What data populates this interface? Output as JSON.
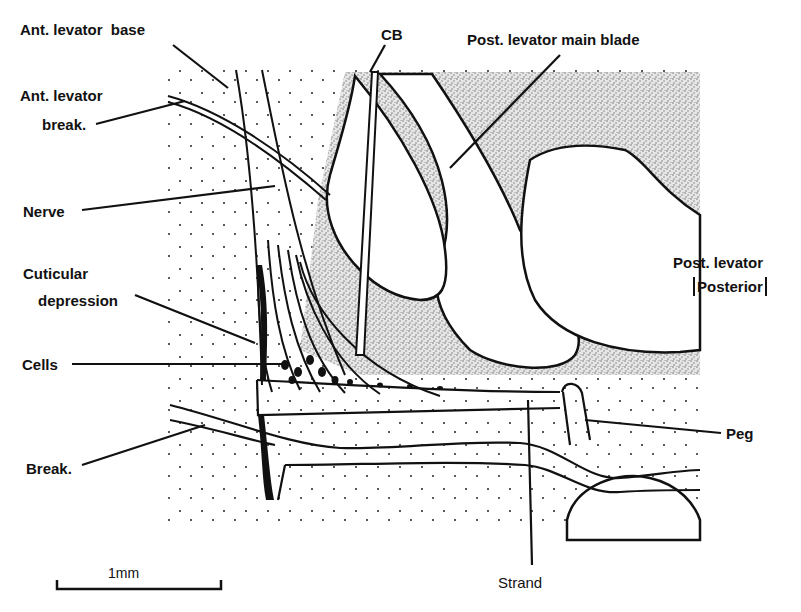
{
  "diagram": {
    "title": "",
    "labels": {
      "ant_levator_base_prefix": "Ant. levator",
      "ant_levator_base_suffix": "base",
      "ant_levator_break_line1": "Ant. levator",
      "ant_levator_break_line2": "break.",
      "nerve": "Nerve",
      "cuticular_depression_line1": "Cuticular",
      "cuticular_depression_line2": "depression",
      "cells": "Cells",
      "break": "Break.",
      "cb": "CB",
      "post_levator_main_blade": "Post. levator main blade",
      "post_levator": "Post. levator",
      "posterior": "Posterior",
      "peg": "Peg",
      "strand": "Strand"
    },
    "scale_bar": {
      "label": "1mm"
    },
    "colors": {
      "ink": "#111111",
      "stipple": "#9a9a9a",
      "background": "#ffffff"
    }
  }
}
